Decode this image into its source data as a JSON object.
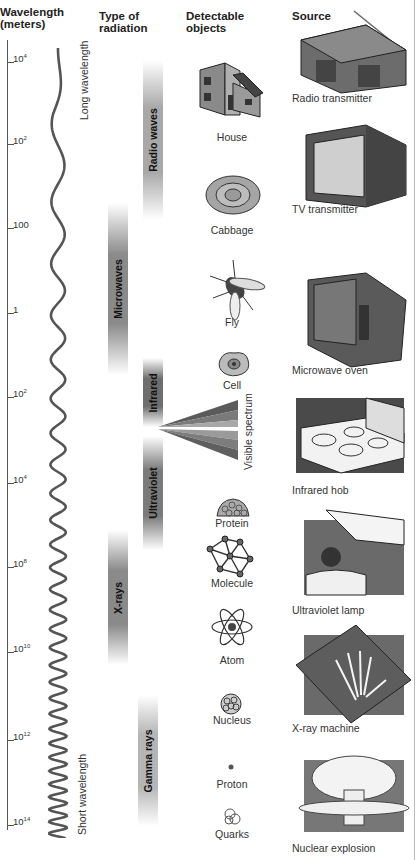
{
  "headers": {
    "wavelength": "Wavelength",
    "wavelength_unit": "(meters)",
    "type_line1": "Type of",
    "type_line2": "radiation",
    "objects_line1": "Detectable",
    "objects_line2": "objects",
    "source": "Source"
  },
  "axis": {
    "ticks": [
      {
        "base": "10",
        "exp": "4",
        "y": 62
      },
      {
        "base": "10",
        "exp": "2",
        "y": 144
      },
      {
        "base": "100",
        "exp": "",
        "y": 228
      },
      {
        "base": "1",
        "exp": "",
        "y": 313
      },
      {
        "base": "10",
        "exp": "2",
        "y": 397
      },
      {
        "base": "10",
        "exp": "4",
        "y": 483
      },
      {
        "base": "10",
        "exp": "8",
        "y": 567
      },
      {
        "base": "10",
        "exp": "10",
        "y": 652
      },
      {
        "base": "10",
        "exp": "12",
        "y": 740
      },
      {
        "base": "10",
        "exp": "14",
        "y": 825
      }
    ],
    "long_label": "Long wavelength",
    "short_label": "Short wavelength"
  },
  "radiation_types": [
    {
      "label": "Radio waves",
      "x": 143,
      "top": 60,
      "bottom": 220,
      "color": "#a8a8a8"
    },
    {
      "label": "Microwaves",
      "x": 108,
      "top": 203,
      "bottom": 375,
      "color": "#8a8a8a"
    },
    {
      "label": "Infrared",
      "x": 143,
      "top": 358,
      "bottom": 427,
      "color": "#6e6e6e"
    },
    {
      "label": "Ultraviolet",
      "x": 143,
      "top": 436,
      "bottom": 550,
      "color": "#7a7a7a"
    },
    {
      "label": "X-rays",
      "x": 108,
      "top": 530,
      "bottom": 665,
      "color": "#8a8a8a"
    },
    {
      "label": "Gamma rays",
      "x": 138,
      "top": 695,
      "bottom": 826,
      "color": "#b5b5b5"
    }
  ],
  "visible_spectrum_label": "Visible spectrum",
  "objects": [
    {
      "label": "House",
      "y": 137
    },
    {
      "label": "Cabbage",
      "y": 230
    },
    {
      "label": "Fly",
      "y": 322
    },
    {
      "label": "Cell",
      "y": 385
    },
    {
      "label": "Protein",
      "y": 523
    },
    {
      "label": "Molecule",
      "y": 583
    },
    {
      "label": "Atom",
      "y": 660
    },
    {
      "label": "Nucleus",
      "y": 720
    },
    {
      "label": "Proton",
      "y": 784
    },
    {
      "label": "Quarks",
      "y": 834
    }
  ],
  "sources": [
    {
      "label": "Radio transmitter",
      "y": 98,
      "box_top": 32,
      "box_h": 62
    },
    {
      "label": "TV transmitter",
      "y": 209,
      "box_top": 130,
      "box_h": 75
    },
    {
      "label": "Microwave oven",
      "y": 370,
      "box_top": 270,
      "box_h": 95
    },
    {
      "label": "Infrared hob",
      "y": 490,
      "box_top": 390,
      "box_h": 85
    },
    {
      "label": "Ultraviolet lamp",
      "y": 610,
      "box_top": 517,
      "box_h": 80
    },
    {
      "label": "X-ray machine",
      "y": 728,
      "box_top": 640,
      "box_h": 80
    },
    {
      "label": "Nuclear explosion",
      "y": 848,
      "box_top": 752,
      "box_h": 80
    }
  ]
}
